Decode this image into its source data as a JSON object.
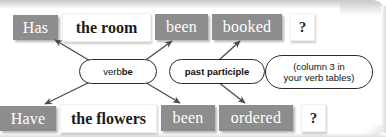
{
  "diagram": {
    "colors": {
      "chip_grey_bg": "#8d8d8d",
      "chip_grey_text": "#ffffff",
      "chip_white_bg": "#ffffff",
      "chip_white_text": "#1c1c1c",
      "bubble_border": "#2b2b2b",
      "arrow": "#4a4a4a",
      "page_bg": "#ffffff"
    },
    "rows": [
      {
        "id": "row-top",
        "name": "example-sentence-top",
        "cells": [
          {
            "name": "aux-verb-has",
            "text": "Has",
            "style": "grey"
          },
          {
            "name": "subject-the-room",
            "text": "the room",
            "style": "white"
          },
          {
            "name": "been-top",
            "text": "been",
            "style": "grey"
          },
          {
            "name": "participle-booked",
            "text": "booked",
            "style": "grey"
          },
          {
            "name": "question-mark-top",
            "text": "?",
            "style": "question"
          }
        ]
      },
      {
        "id": "row-bottom",
        "name": "example-sentence-bottom",
        "cells": [
          {
            "name": "aux-verb-have",
            "text": "Have",
            "style": "grey"
          },
          {
            "name": "subject-the-flowers",
            "text": "the flowers",
            "style": "white"
          },
          {
            "name": "been-bottom",
            "text": "been",
            "style": "grey"
          },
          {
            "name": "participle-ordered",
            "text": "ordered",
            "style": "grey"
          },
          {
            "name": "question-mark-bottom",
            "text": "?",
            "style": "question"
          }
        ]
      }
    ],
    "bubbles": [
      {
        "name": "callout-verb-be",
        "plain": "verb ",
        "bold": "be"
      },
      {
        "name": "callout-past-participle",
        "bold": "past participle"
      },
      {
        "name": "callout-verb-tables",
        "line1": "(column 3 in",
        "line2": "your verb tables)"
      }
    ]
  }
}
